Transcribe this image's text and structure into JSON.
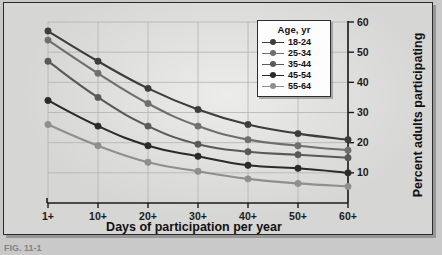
{
  "figure": {
    "caption_fragment": "FIG. 11-1"
  },
  "legend": {
    "title": "Age, yr",
    "entries": [
      {
        "label": "18-24",
        "color": "#3d3d3d"
      },
      {
        "label": "25-34",
        "color": "#6f6f6f"
      },
      {
        "label": "35-44",
        "color": "#595959"
      },
      {
        "label": "45-54",
        "color": "#2a2a2a"
      },
      {
        "label": "55-64",
        "color": "#8f8f8f"
      }
    ]
  },
  "chart_data": {
    "type": "line",
    "title": "",
    "xlabel": "Days of participation per year",
    "ylabel": "Percent adults participating",
    "categories": [
      "1+",
      "10+",
      "20+",
      "30+",
      "40+",
      "50+",
      "60+"
    ],
    "x": [
      1,
      10,
      20,
      30,
      40,
      50,
      60
    ],
    "ylim": [
      0,
      60
    ],
    "yticks": [
      10,
      20,
      30,
      40,
      50,
      60
    ],
    "ytick_labels": [
      "10",
      "20",
      "30",
      "40",
      "50",
      "60"
    ],
    "y_axis_position": "right",
    "grid": true,
    "legend_position": "top-right",
    "series": [
      {
        "name": "18-24",
        "color": "#3d3d3d",
        "values": [
          57,
          47,
          38,
          31,
          26,
          23,
          21
        ]
      },
      {
        "name": "25-34",
        "color": "#6f6f6f",
        "values": [
          54,
          43,
          33,
          25.5,
          21,
          19,
          17.5
        ]
      },
      {
        "name": "35-44",
        "color": "#595959",
        "values": [
          47,
          35,
          25.5,
          19.5,
          17,
          16,
          15
        ]
      },
      {
        "name": "45-54",
        "color": "#2a2a2a",
        "values": [
          34,
          25.5,
          19,
          15.5,
          12.5,
          11.5,
          10
        ]
      },
      {
        "name": "55-64",
        "color": "#8f8f8f",
        "values": [
          26,
          19,
          13.5,
          10.5,
          8,
          6.5,
          5.5
        ]
      }
    ]
  }
}
